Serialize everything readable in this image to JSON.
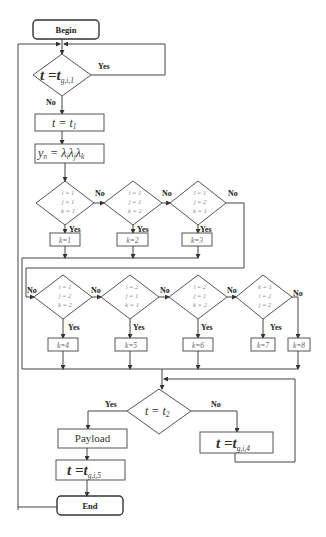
{
  "flowchart": {
    "begin": "Begin",
    "end": "End",
    "decision_start": {
      "lhs": "t",
      "eq": " =",
      "rhs": "t",
      "sub": "g,i,1",
      "yes": "Yes",
      "no": "No"
    },
    "step_t1": {
      "lhs": "t",
      "eq": " = ",
      "rhs": "t",
      "sub": "1"
    },
    "step_yn": {
      "text": "y",
      "sub_n": "n",
      "eq": " = λ",
      "s1": "i",
      "l2": "λ",
      "s2": "j",
      "l3": "λ",
      "s3": "k"
    },
    "row1": [
      {
        "cond": [
          "i = 1",
          "j = 1",
          "k = 1"
        ],
        "result": "k=1",
        "yes": "Yes",
        "no": "No"
      },
      {
        "cond": [
          "i = 1",
          "j = 1",
          "k = 2"
        ],
        "result": "k=2",
        "yes": "Yes",
        "no": "No"
      },
      {
        "cond": [
          "i = 1",
          "j = 2",
          "k = 1"
        ],
        "result": "k=3",
        "yes": "Yes",
        "no": "No"
      }
    ],
    "row2": [
      {
        "cond": [
          "i = 1",
          "j = 2",
          "k = 2"
        ],
        "result": "k=4",
        "yes": "Yes",
        "no": "No"
      },
      {
        "cond": [
          "i = 2",
          "j = 1",
          "k = 1"
        ],
        "result": "k=5",
        "yes": "Yes",
        "no": "No"
      },
      {
        "cond": [
          "i = 2",
          "j = 1",
          "k = 2"
        ],
        "result": "k=6",
        "yes": "Yes",
        "no": "No"
      },
      {
        "cond": [
          "k = 1",
          "i = 2",
          "j = 2"
        ],
        "result": "k=7",
        "yes": "Yes",
        "no": "No"
      }
    ],
    "fallback": {
      "result": "k=8"
    },
    "decision_t2": {
      "lhs": "t",
      "eq": " = ",
      "rhs": "t",
      "sub": "2",
      "yes": "Yes",
      "no": "No"
    },
    "payload": "Payload",
    "step_t5": {
      "lhs": "t",
      "eq": " =",
      "rhs": "t",
      "sub": "g,i,5"
    },
    "step_t4": {
      "lhs": "t",
      "eq": " =",
      "rhs": "t",
      "sub": "g,i,4"
    }
  }
}
